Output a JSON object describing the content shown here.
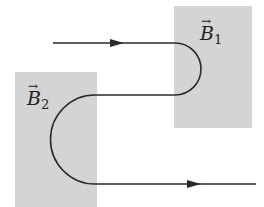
{
  "figure": {
    "regions": [
      {
        "id": "B1",
        "symbol": "B",
        "subscript": "1",
        "x": 174,
        "y": 6,
        "w": 78,
        "h": 122
      },
      {
        "id": "B2",
        "symbol": "B",
        "subscript": "2",
        "x": 15,
        "y": 72,
        "w": 82,
        "h": 135
      }
    ],
    "region_color": "#d4d4d4",
    "path_color": "#2a2a2a",
    "vector_arrow": "→"
  }
}
